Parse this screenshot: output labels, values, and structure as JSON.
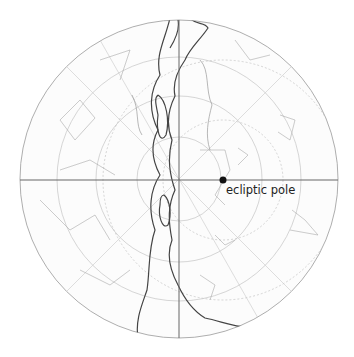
{
  "diagram": {
    "type": "polar-star-map",
    "center": [
      179,
      179
    ],
    "radius": 159,
    "axes": {
      "color": "#666666",
      "horizontal_y": 180,
      "vertical_x": 179
    },
    "declination_rings_radii": [
      40,
      80,
      120
    ],
    "ring_color": "#bbbbbb",
    "milky_way_color": "#444444",
    "constellation_line_color": "#aaaaaa",
    "marker": {
      "label": "ecliptic pole",
      "x": 223,
      "y": 180,
      "color": "#111111"
    }
  }
}
